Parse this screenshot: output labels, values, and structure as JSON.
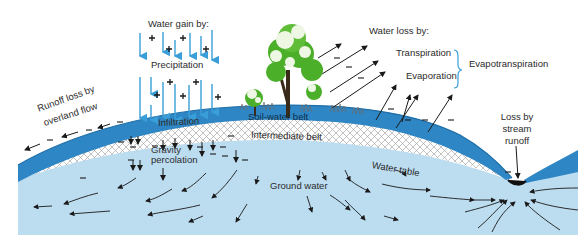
{
  "labels": {
    "water_gain_heading": "Water gain by:",
    "precipitation": "Precipitation",
    "infiltration": "Infiltration",
    "gravity_percolation_1": "Gravity",
    "gravity_percolation_2": "percolation",
    "runoff_overland_1": "Runoff loss by",
    "runoff_overland_2": "overland flow",
    "water_loss_heading": "Water loss by:",
    "transpiration": "Transpiration",
    "evaporation": "Evaporation",
    "evapotranspiration": "Evapotranspiration",
    "soil_water_belt": "Soil-water belt",
    "intermediate_belt": "Intermediate belt",
    "water_table": "Water table",
    "ground_water": "Ground water",
    "stream_loss_1": "Loss by",
    "stream_loss_2": "stream",
    "stream_loss_3": "runoff"
  },
  "symbols": {
    "gain": "+",
    "loss": "–"
  },
  "colors": {
    "precip_arrow": "#3a9fd8",
    "soil_water_belt": "#2f86c4",
    "soil_water_belt_dark": "#1f6ea8",
    "intermediate_belt_bg": "#ffffff",
    "intermediate_hatch": "#8a8a8a",
    "ground_water": "#bcdcf0",
    "tree_foliage": "#4caf2a",
    "tree_light": "#e9f5df",
    "text": "#2b2b2b",
    "bracket": "#3a9fd8"
  }
}
